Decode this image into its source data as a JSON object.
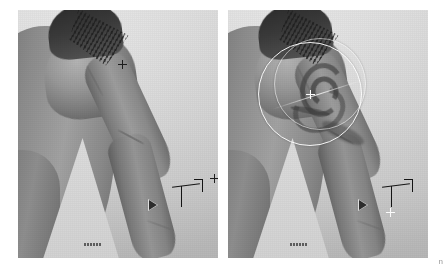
{
  "view": {
    "type": "before-after-comparison",
    "layout": "side-by-side",
    "media_kind": "grayscale-photograph",
    "subject": "person's shoulder, upper arm and forearm",
    "background_color": "#ffffff",
    "panel_background_color": "#d6d6d6",
    "overlay_color": "#ffffff",
    "marker_color": "#1a1a1a"
  },
  "panels": [
    {
      "id": "before",
      "name": "Before",
      "caption": "",
      "has_brush_overlay": false,
      "tattoo_visible": false,
      "markers": [
        {
          "kind": "crosshair",
          "color": "#1a1a1a",
          "x": 122,
          "y": 64
        },
        {
          "kind": "crosshair",
          "color": "#1a1a1a",
          "x": 214,
          "y": 178
        },
        {
          "kind": "t-measure",
          "color": "#1a1a1a",
          "x": 176,
          "y": 186
        },
        {
          "kind": "triangle-pointer",
          "color": "#1a1a1a",
          "x": 152,
          "y": 208
        }
      ]
    },
    {
      "id": "after",
      "name": "After",
      "caption": "",
      "has_brush_overlay": true,
      "tattoo_visible": true,
      "brush": {
        "shape": "circle",
        "stroke_color": "#ffffff",
        "center_x": 300,
        "center_y": 92,
        "radius": 52,
        "ghost_radius": 46,
        "has_center_crosshair": true,
        "has_guide_ray": true
      },
      "markers": [
        {
          "kind": "crosshair",
          "color": "#ffffff",
          "x": 300,
          "y": 92
        },
        {
          "kind": "t-measure",
          "color": "#1a1a1a",
          "x": 386,
          "y": 186
        },
        {
          "kind": "triangle-pointer",
          "color": "#1a1a1a",
          "x": 362,
          "y": 208
        },
        {
          "kind": "crosshair",
          "color": "#ffffff",
          "x": 390,
          "y": 212
        }
      ]
    }
  ],
  "annotations": {
    "before_caption_label": "",
    "after_caption_label": "",
    "corner_mark": "n"
  }
}
